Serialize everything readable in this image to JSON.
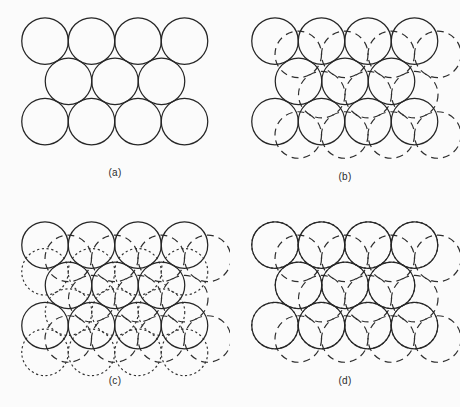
{
  "figure": {
    "type": "close-packing-of-spheres-diagram",
    "width": 460,
    "height": 407,
    "background_color": "#fbfbfb",
    "stroke_color": "#262626"
  },
  "geometry": {
    "sphere_diameter": 46.5,
    "sphere_radius": 23.25,
    "row_spacing": 40.3,
    "rows": [
      {
        "count": 4,
        "start_x": 45.0,
        "y": 41.0
      },
      {
        "count": 3,
        "start_x": 68.5,
        "y": 81.3
      },
      {
        "count": 4,
        "start_x": 45.0,
        "y": 121.6
      }
    ],
    "layer_b_offset": {
      "dx": 23.25,
      "dy": 13.4
    },
    "layer_c_offset_ccp": {
      "dx": 0.0,
      "dy": 26.8
    },
    "layer_c_offset_hcp": {
      "dx": 0.0,
      "dy": 0.0
    }
  },
  "panels": [
    {
      "id": "a",
      "label": "(a)",
      "layers": [
        "A"
      ],
      "description": "Single close-packed layer of equal spheres, solid outlines",
      "label_x": 115,
      "label_y": 172
    },
    {
      "id": "b",
      "label": "(b)",
      "layers": [
        "A",
        "B"
      ],
      "description": "Second layer added in alternate hollows, shown dashed",
      "label_x": 115,
      "label_y": 176
    },
    {
      "id": "c",
      "label": "(c)",
      "layers": [
        "A",
        "B",
        "C"
      ],
      "description": "Third layer over remaining hollows, cubic close packing ABC, shown dotted",
      "label_x": 115,
      "label_y": 176
    },
    {
      "id": "d",
      "label": "(d)",
      "layers": [
        "A",
        "B",
        "A"
      ],
      "description": "Third layer directly above first, hexagonal close packing ABA, dotted outlines coincide with solid",
      "label_x": 115,
      "label_y": 176
    }
  ],
  "line_styles": {
    "layer_a": "solid",
    "layer_b": "long-dashed",
    "layer_c": "fine-dotted"
  }
}
